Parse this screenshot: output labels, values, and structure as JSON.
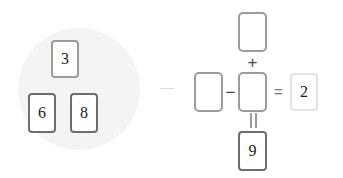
{
  "puzzle": {
    "type": "number-card-equation",
    "tray": {
      "label": "Available number cards",
      "cards": [
        {
          "value": "3",
          "border": "mid"
        },
        {
          "value": "6",
          "border": "dark"
        },
        {
          "value": "8",
          "border": "dark"
        }
      ]
    },
    "board": {
      "label": "Equation cross",
      "top_slot": {
        "value": "",
        "placeholder": "",
        "filled": false
      },
      "left_slot": {
        "value": "",
        "placeholder": "",
        "filled": false
      },
      "center_slot": {
        "value": "",
        "placeholder": "",
        "filled": false
      },
      "right_card": {
        "value": "2",
        "border": "faint",
        "filled": true
      },
      "bottom_card": {
        "value": "9",
        "border": "dark",
        "filled": true
      },
      "operators": {
        "vertical_top": "+",
        "horizontal_left": "−",
        "horizontal_right": "=",
        "vertical_bottom": "="
      }
    },
    "colors": {
      "card_background": "#ffffff",
      "border_mid": "#9b9b9b",
      "border_dark": "#6e6e6e",
      "border_faint": "#e2e2e2",
      "operator": "#4a4a4a",
      "tray_backdrop": "#f4f4f4",
      "divider": "#d8d8d8",
      "page_background": "#ffffff",
      "digit": "#1b1b1b"
    }
  }
}
